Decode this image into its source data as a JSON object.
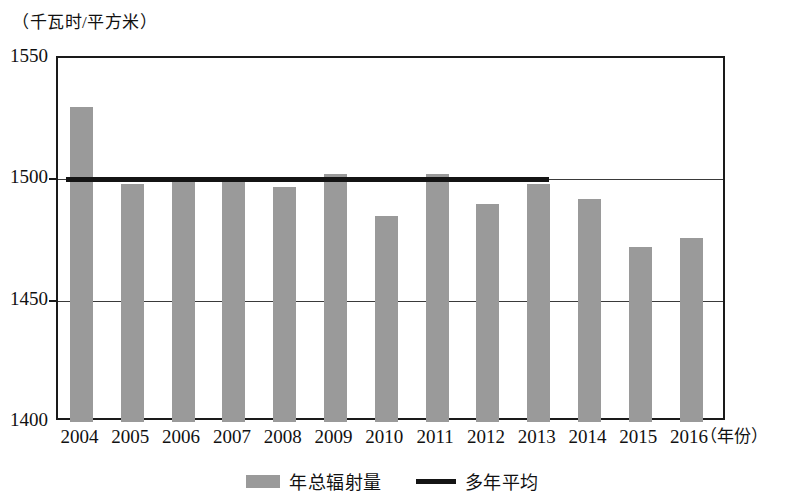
{
  "chart_data": {
    "type": "bar",
    "title": "",
    "subtitle": "",
    "xlabel": "（年份）",
    "ylabel": "（千瓦时/平方米）",
    "categories": [
      "2004",
      "2005",
      "2006",
      "2007",
      "2008",
      "2009",
      "2010",
      "2011",
      "2012",
      "2013",
      "2014",
      "2015",
      "2016"
    ],
    "values": [
      1530,
      1498,
      1501,
      1501,
      1497,
      1502,
      1485,
      1502,
      1490,
      1498,
      1492,
      1472,
      1476
    ],
    "ylim": [
      1400,
      1550
    ],
    "yticks": [
      1400,
      1450,
      1500,
      1550
    ],
    "ytick_labels": [
      "1400",
      "1450",
      "1500",
      "1550"
    ],
    "grid": true,
    "legend_position": "bottom",
    "series": [
      {
        "name": "年总辐射量",
        "type": "bar",
        "color": "#9a9a9a",
        "values": [
          1530,
          1498,
          1501,
          1501,
          1497,
          1502,
          1485,
          1502,
          1490,
          1498,
          1492,
          1472,
          1476
        ]
      },
      {
        "name": "多年平均",
        "type": "line",
        "color": "#141414",
        "value": 1500,
        "x_start": "2004",
        "x_end": "2013"
      }
    ]
  },
  "legend": {
    "items": [
      {
        "label": "年总辐射量",
        "marker": "bar-swatch",
        "color": "#9a9a9a"
      },
      {
        "label": "多年平均",
        "marker": "line-swatch",
        "color": "#141414"
      }
    ]
  }
}
